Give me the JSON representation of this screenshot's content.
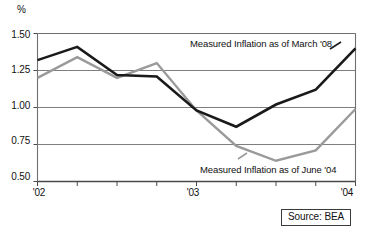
{
  "chart_data": {
    "type": "line",
    "title": "",
    "subtitle": "",
    "xlabel": "",
    "ylabel": "%",
    "ylim": [
      0.5,
      1.5
    ],
    "yticks": [
      "0.50",
      "0.75",
      "1.00",
      "1.25",
      "1.50"
    ],
    "ytick_values": [
      0.5,
      0.75,
      1.0,
      1.25,
      1.5
    ],
    "grid": true,
    "grid_orientation": "horizontal",
    "xticks": [
      "'02",
      "'03",
      "'04"
    ],
    "xtick_positions": [
      0,
      4,
      8
    ],
    "x_minor_tick_count": 9,
    "x": [
      0,
      1,
      2,
      3,
      4,
      5,
      6,
      7,
      8
    ],
    "legend_position": "inline-annotation",
    "series": [
      {
        "name": "Measured Inflation as of March '08",
        "color": "#1a1a1a",
        "width": 2.6,
        "values": [
          1.32,
          1.41,
          1.22,
          1.21,
          0.98,
          0.87,
          1.02,
          1.12,
          1.4
        ]
      },
      {
        "name": "Measured Inflation as of June '04",
        "color": "#9a9a9a",
        "width": 2.4,
        "values": [
          1.2,
          1.34,
          1.2,
          1.3,
          0.98,
          0.74,
          0.64,
          0.71,
          0.99
        ]
      }
    ],
    "annotations": [
      {
        "text": "Measured Inflation as of March '08",
        "series": 0
      },
      {
        "text": "Measured Inflation as of June '04",
        "series": 1
      }
    ],
    "source": "Source: BEA"
  },
  "axis": {
    "y_unit": "%",
    "y_labels": [
      "1.50",
      "1.25",
      "1.00",
      "0.75",
      "0.50"
    ],
    "x_labels": [
      "'02",
      "'03",
      "'04"
    ]
  },
  "footer": {
    "source_label": "Source: BEA"
  }
}
